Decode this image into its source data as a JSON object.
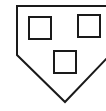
{
  "diagram": {
    "stroke_color": "#1a1a1a",
    "background": "#ffffff",
    "outline_points": "17,6 110,6 110,55 65,102 17,55",
    "squares": [
      {
        "x": 29,
        "y": 17,
        "w": 22,
        "h": 22
      },
      {
        "x": 78,
        "y": 15,
        "w": 22,
        "h": 22
      },
      {
        "x": 54,
        "y": 51,
        "w": 22,
        "h": 22
      }
    ]
  }
}
